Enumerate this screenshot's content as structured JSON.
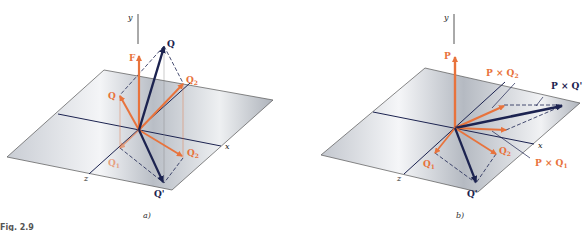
{
  "figure": {
    "caption_label": "Fig. 2.9",
    "colors": {
      "orange": "#e8733c",
      "navy": "#1c2350",
      "plane": "#cfd3da",
      "line": "#333333"
    }
  },
  "panel_a": {
    "subcaption": "a)",
    "axes": {
      "x": "x",
      "y": "y",
      "z": "z"
    },
    "vectors": {
      "F": "F",
      "Q": "Q",
      "Q1": "Q",
      "Q2": "Q",
      "Q2_sub": "2",
      "Q1p": "Q",
      "Q1p_sub": "1",
      "Q2p": "Q",
      "Q2p_sub": "2",
      "Qp": "Q'"
    }
  },
  "panel_b": {
    "subcaption": "b)",
    "axes": {
      "x": "x",
      "y": "y",
      "z": "z"
    },
    "vectors": {
      "P": "P",
      "PxQ2p": "P × Q",
      "PxQ2p_sub": "2",
      "PxQp": "P × Q'",
      "PxQ1p": "P × Q",
      "PxQ1p_sub": "1",
      "Q1p": "Q",
      "Q1p_sub": "1",
      "Q2p": "Q",
      "Q2p_sub": "2",
      "Qp": "Q'"
    }
  }
}
